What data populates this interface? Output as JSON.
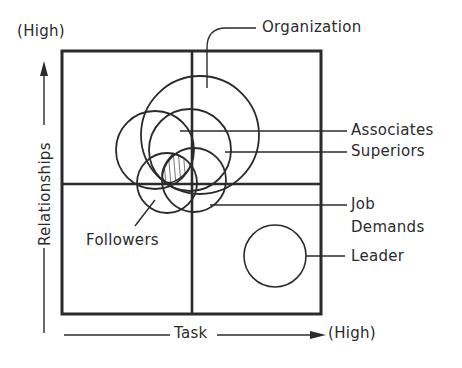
{
  "diagram": {
    "title": "",
    "axes": {
      "x_label": "Task",
      "x_high_label": "(High)",
      "y_label": "Relationships",
      "y_high_label": "(High)"
    },
    "quadrants": {
      "layout": "2x2 grid",
      "description": "Task (horizontal) vs Relationships (vertical)"
    },
    "circles": [
      {
        "label": "Organization",
        "cx": 200,
        "cy": 135,
        "r": 59
      },
      {
        "label": "Associates",
        "cx": 155,
        "cy": 150,
        "r": 39
      },
      {
        "label": "Superiors",
        "cx": 190,
        "cy": 150,
        "r": 41
      },
      {
        "label": "Followers",
        "cx": 167,
        "cy": 183,
        "r": 30
      },
      {
        "label": "Job Demands",
        "cx": 194,
        "cy": 180,
        "r": 32
      },
      {
        "label": "Leader",
        "cx": 275,
        "cy": 256,
        "r": 31
      }
    ],
    "labels": {
      "organization": "Organization",
      "associates": "Associates",
      "superiors": "Superiors",
      "job_demands_line1": "Job",
      "job_demands_line2": "Demands",
      "leader": "Leader",
      "followers": "Followers"
    },
    "hatched_region": "overlap of environmental factors (shaded)",
    "colors": {
      "ink": "#2b2b2b",
      "background": "#ffffff"
    }
  }
}
